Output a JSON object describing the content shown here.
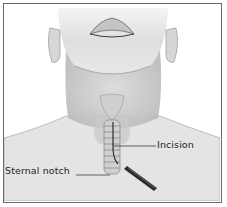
{
  "figure": {
    "labels": {
      "incision": "Incision",
      "sternal_notch": "Sternal notch"
    },
    "colors": {
      "frame": "#6a6a6a",
      "skin_light": "#ececec",
      "skin_shade": "#bdbdbd",
      "line": "#2a2a2a",
      "background": "#ffffff"
    },
    "icons": {
      "scalpel": "scalpel-icon"
    }
  }
}
